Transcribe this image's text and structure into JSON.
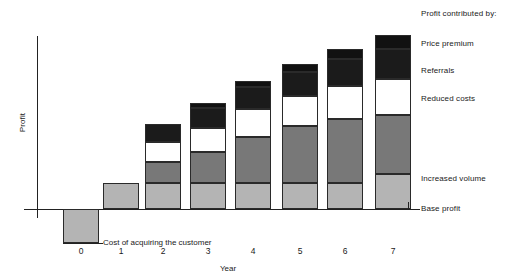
{
  "chart_data": {
    "type": "bar",
    "subtype": "stacked-bar-with-negative",
    "title": "",
    "xlabel": "Year",
    "ylabel": "Profit",
    "categories": [
      "0",
      "1",
      "2",
      "3",
      "4",
      "5",
      "6",
      "7"
    ],
    "grid": false,
    "axis_values_shown": false,
    "legend_position": "right",
    "legend_title": "Profit contributed by:",
    "annotations": [
      {
        "text": "Cost of acquiring the customer",
        "target_category": "0"
      }
    ],
    "series": [
      {
        "name": "Base profit",
        "color": "#b4b4b4",
        "values": [
          0,
          26,
          26,
          26,
          26,
          26,
          26,
          26
        ]
      },
      {
        "name": "Increased volume",
        "color": "#787878",
        "values": [
          0,
          0,
          21,
          31,
          45,
          57,
          57,
          59
        ]
      },
      {
        "name": "Reduced costs",
        "color": "#ffffff",
        "values": [
          0,
          0,
          20,
          24,
          28,
          30,
          33,
          36
        ]
      },
      {
        "name": "Referrals",
        "color": "#1b1b1b",
        "values": [
          0,
          0,
          18,
          20,
          22,
          24,
          27,
          30
        ]
      },
      {
        "name": "Price premium",
        "color": "#111111",
        "values": [
          0,
          0,
          0,
          5,
          6,
          8,
          17,
          14
        ]
      },
      {
        "name": "Cost of acquiring the customer",
        "color": "#b4b4b4",
        "values": [
          -34,
          0,
          0,
          0,
          0,
          0,
          0,
          0
        ]
      }
    ],
    "legend_entries": [
      "Price premium",
      "Referrals",
      "Reduced costs",
      "Increased volume",
      "Base profit"
    ]
  },
  "geometry": {
    "baseline_y": 209,
    "bar_width": 36,
    "bar_centers": [
      81,
      121,
      163,
      208,
      253,
      300,
      345,
      393
    ],
    "bars": [
      {
        "category": "0",
        "segments": [
          {
            "series": "Cost of acquiring the customer",
            "class": "s-acq",
            "top": 209,
            "height": 34
          }
        ]
      },
      {
        "category": "1",
        "segments": [
          {
            "series": "Base profit",
            "class": "s-base",
            "top": 183,
            "height": 26
          }
        ]
      },
      {
        "category": "2",
        "segments": [
          {
            "series": "Referrals",
            "class": "s-referrals",
            "top": 124,
            "height": 18
          },
          {
            "series": "Reduced costs",
            "class": "s-costs",
            "top": 142,
            "height": 20
          },
          {
            "series": "Increased volume",
            "class": "s-volume",
            "top": 162,
            "height": 21
          },
          {
            "series": "Base profit",
            "class": "s-base",
            "top": 183,
            "height": 26
          }
        ]
      },
      {
        "category": "3",
        "segments": [
          {
            "series": "Price premium",
            "class": "s-premium",
            "top": 103,
            "height": 5
          },
          {
            "series": "Referrals",
            "class": "s-referrals",
            "top": 108,
            "height": 20
          },
          {
            "series": "Reduced costs",
            "class": "s-costs",
            "top": 128,
            "height": 24
          },
          {
            "series": "Increased volume",
            "class": "s-volume",
            "top": 152,
            "height": 31
          },
          {
            "series": "Base profit",
            "class": "s-base",
            "top": 183,
            "height": 26
          }
        ]
      },
      {
        "category": "4",
        "segments": [
          {
            "series": "Price premium",
            "class": "s-premium",
            "top": 81,
            "height": 6
          },
          {
            "series": "Referrals",
            "class": "s-referrals",
            "top": 87,
            "height": 22
          },
          {
            "series": "Reduced costs",
            "class": "s-costs",
            "top": 109,
            "height": 28
          },
          {
            "series": "Increased volume",
            "class": "s-volume",
            "top": 137,
            "height": 46
          },
          {
            "series": "Base profit",
            "class": "s-base",
            "top": 183,
            "height": 26
          }
        ]
      },
      {
        "category": "5",
        "segments": [
          {
            "series": "Price premium",
            "class": "s-premium",
            "top": 64,
            "height": 8
          },
          {
            "series": "Referrals",
            "class": "s-referrals",
            "top": 72,
            "height": 24
          },
          {
            "series": "Reduced costs",
            "class": "s-costs",
            "top": 96,
            "height": 30
          },
          {
            "series": "Increased volume",
            "class": "s-volume",
            "top": 126,
            "height": 57
          },
          {
            "series": "Base profit",
            "class": "s-base",
            "top": 183,
            "height": 26
          }
        ]
      },
      {
        "category": "6",
        "segments": [
          {
            "series": "Price premium",
            "class": "s-premium",
            "top": 49,
            "height": 10
          },
          {
            "series": "Referrals",
            "class": "s-referrals",
            "top": 59,
            "height": 27
          },
          {
            "series": "Reduced costs",
            "class": "s-costs",
            "top": 86,
            "height": 33
          },
          {
            "series": "Increased volume",
            "class": "s-volume",
            "top": 119,
            "height": 64
          },
          {
            "series": "Base profit",
            "class": "s-base",
            "top": 183,
            "height": 26
          }
        ]
      },
      {
        "category": "7",
        "segments": [
          {
            "series": "Price premium",
            "class": "s-premium",
            "top": 35,
            "height": 14
          },
          {
            "series": "Referrals",
            "class": "s-referrals",
            "top": 49,
            "height": 30
          },
          {
            "series": "Reduced costs",
            "class": "s-costs",
            "top": 79,
            "height": 36
          },
          {
            "series": "Increased volume",
            "class": "s-volume",
            "top": 115,
            "height": 59
          },
          {
            "series": "Base profit",
            "class": "s-base",
            "top": 174,
            "height": 35
          }
        ]
      }
    ],
    "legend_label_tops": [
      {
        "text": "Profit contributed by:",
        "top": 9
      },
      {
        "text": "Price premium",
        "top": 39
      },
      {
        "text": "Referrals",
        "top": 66
      },
      {
        "text": "Reduced costs",
        "top": 94
      },
      {
        "text": "Increased volume",
        "top": 174
      },
      {
        "text": "Base profit",
        "top": 204
      }
    ]
  }
}
